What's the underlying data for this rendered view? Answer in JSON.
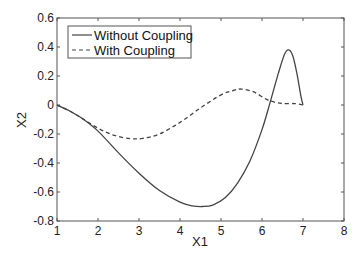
{
  "chart_data": {
    "type": "line",
    "title": "",
    "xlabel": "X1",
    "ylabel": "X2",
    "xlim": [
      1,
      8
    ],
    "ylim": [
      -0.8,
      0.6
    ],
    "xticks": [
      1,
      2,
      3,
      4,
      5,
      6,
      7,
      8
    ],
    "yticks": [
      -0.8,
      -0.6,
      -0.4,
      -0.2,
      0,
      0.2,
      0.4,
      0.6
    ],
    "xtick_labels": [
      "1",
      "2",
      "3",
      "4",
      "5",
      "6",
      "7",
      "8"
    ],
    "ytick_labels": [
      "-0.8",
      "-0.6",
      "-0.4",
      "-0.2",
      "0",
      "0.2",
      "0.4",
      "0.6"
    ],
    "grid": false,
    "legend_position": "upper left",
    "series": [
      {
        "name": "Without Coupling",
        "style": "solid",
        "color": "#444444",
        "x": [
          1.0,
          1.3,
          1.6,
          2.0,
          2.5,
          3.0,
          3.5,
          4.0,
          4.3,
          4.55,
          4.8,
          5.1,
          5.4,
          5.7,
          6.0,
          6.2,
          6.4,
          6.55,
          6.65,
          6.75,
          6.85,
          6.95,
          7.0
        ],
        "y": [
          0.0,
          -0.04,
          -0.09,
          -0.18,
          -0.33,
          -0.47,
          -0.59,
          -0.67,
          -0.695,
          -0.7,
          -0.69,
          -0.64,
          -0.54,
          -0.39,
          -0.17,
          0.02,
          0.22,
          0.35,
          0.38,
          0.34,
          0.22,
          0.06,
          0.0
        ]
      },
      {
        "name": "With Coupling",
        "style": "dashed",
        "color": "#444444",
        "x": [
          1.0,
          1.3,
          1.6,
          2.0,
          2.4,
          2.8,
          3.1,
          3.5,
          4.0,
          4.5,
          5.0,
          5.3,
          5.5,
          5.8,
          6.1,
          6.3,
          6.5,
          6.8,
          7.0
        ],
        "y": [
          0.0,
          -0.04,
          -0.09,
          -0.16,
          -0.21,
          -0.232,
          -0.23,
          -0.2,
          -0.12,
          -0.02,
          0.07,
          0.1,
          0.11,
          0.09,
          0.04,
          0.02,
          0.01,
          0.01,
          0.0
        ]
      }
    ]
  },
  "legend": {
    "items": [
      {
        "label": "Without Coupling",
        "style": "solid"
      },
      {
        "label": "With Coupling",
        "style": "dashed"
      }
    ]
  },
  "axes": {
    "xlabel": "X1",
    "ylabel": "X2"
  }
}
